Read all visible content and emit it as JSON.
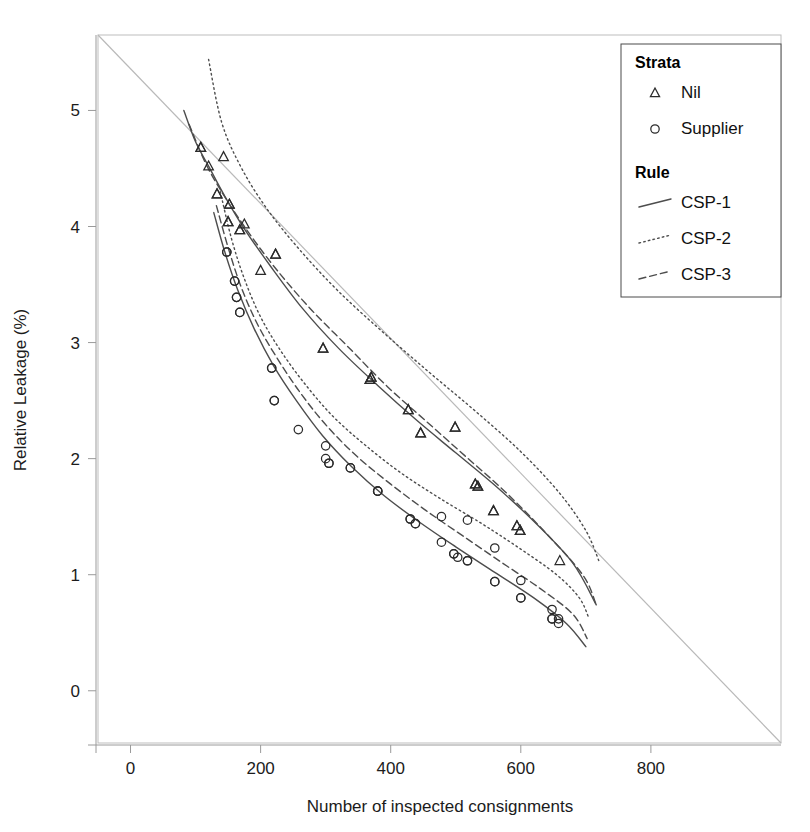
{
  "chart_data": {
    "type": "scatter",
    "title": "",
    "xlabel": "Number of inspected consignments",
    "ylabel": "Relative Leakage (%)",
    "xlim": [
      -50,
      1000
    ],
    "ylim": [
      -0.45,
      5.65
    ],
    "xticks": [
      0,
      200,
      400,
      600,
      800
    ],
    "yticks": [
      0,
      1,
      2,
      3,
      4,
      5
    ],
    "grid": false,
    "legend_position": "top-right",
    "reference_line": {
      "name": "diagonal",
      "points": [
        [
          -50,
          5.65
        ],
        [
          1000,
          -0.45
        ]
      ]
    },
    "legend": {
      "groups": [
        {
          "heading": "Strata",
          "entries": [
            {
              "label": "Nil",
              "marker": "triangle"
            },
            {
              "label": "Supplier",
              "marker": "circle"
            }
          ]
        },
        {
          "heading": "Rule",
          "entries": [
            {
              "label": "CSP-1",
              "line": "solid"
            },
            {
              "label": "CSP-2",
              "line": "dotted"
            },
            {
              "label": "CSP-3",
              "line": "dashed"
            }
          ]
        }
      ]
    },
    "series": [
      {
        "name": "Nil / CSP-1",
        "strata": "Nil",
        "rule": "CSP-1",
        "marker": "triangle",
        "line": "solid",
        "curve": [
          [
            82,
            5.0
          ],
          [
            100,
            4.73
          ],
          [
            120,
            4.52
          ],
          [
            145,
            4.26
          ],
          [
            175,
            3.98
          ],
          [
            215,
            3.66
          ],
          [
            265,
            3.29
          ],
          [
            320,
            2.95
          ],
          [
            380,
            2.63
          ],
          [
            440,
            2.33
          ],
          [
            500,
            2.05
          ],
          [
            560,
            1.77
          ],
          [
            620,
            1.46
          ],
          [
            680,
            1.1
          ],
          [
            716,
            0.74
          ]
        ],
        "points": [
          [
            108,
            4.68
          ],
          [
            120,
            4.52
          ],
          [
            133,
            4.28
          ],
          [
            150,
            4.04
          ],
          [
            152,
            4.19
          ],
          [
            168,
            3.97
          ],
          [
            223,
            3.76
          ],
          [
            296,
            2.95
          ],
          [
            368,
            2.68
          ],
          [
            370,
            2.7
          ],
          [
            427,
            2.42
          ],
          [
            446,
            2.22
          ],
          [
            499,
            2.27
          ],
          [
            530,
            1.78
          ],
          [
            534,
            1.76
          ],
          [
            558,
            1.55
          ],
          [
            594,
            1.42
          ],
          [
            599,
            1.38
          ]
        ]
      },
      {
        "name": "Nil / CSP-2",
        "strata": "Nil",
        "rule": "CSP-2",
        "marker": "triangle",
        "line": "dotted",
        "curve": [
          [
            120,
            5.44
          ],
          [
            140,
            4.9
          ],
          [
            170,
            4.51
          ],
          [
            210,
            4.15
          ],
          [
            260,
            3.8
          ],
          [
            320,
            3.44
          ],
          [
            390,
            3.08
          ],
          [
            460,
            2.74
          ],
          [
            530,
            2.41
          ],
          [
            600,
            2.06
          ],
          [
            660,
            1.7
          ],
          [
            700,
            1.38
          ],
          [
            720,
            1.12
          ]
        ],
        "points": [
          [
            143,
            4.6
          ],
          [
            152,
            4.19
          ],
          [
            175,
            4.02
          ],
          [
            223,
            3.76
          ],
          [
            296,
            2.95
          ],
          [
            370,
            2.7
          ],
          [
            446,
            2.22
          ],
          [
            499,
            2.27
          ],
          [
            558,
            1.55
          ],
          [
            594,
            1.42
          ],
          [
            660,
            1.12
          ]
        ]
      },
      {
        "name": "Nil / CSP-3",
        "strata": "Nil",
        "rule": "CSP-3",
        "marker": "triangle",
        "line": "dashed",
        "curve": [
          [
            90,
            4.88
          ],
          [
            115,
            4.55
          ],
          [
            140,
            4.3
          ],
          [
            175,
            4.0
          ],
          [
            220,
            3.66
          ],
          [
            275,
            3.3
          ],
          [
            335,
            2.96
          ],
          [
            395,
            2.62
          ],
          [
            455,
            2.32
          ],
          [
            515,
            2.02
          ],
          [
            575,
            1.72
          ],
          [
            635,
            1.38
          ],
          [
            695,
            1.0
          ],
          [
            716,
            0.74
          ]
        ],
        "points": [
          [
            108,
            4.68
          ],
          [
            133,
            4.28
          ],
          [
            150,
            4.04
          ],
          [
            168,
            3.97
          ],
          [
            200,
            3.62
          ],
          [
            368,
            2.68
          ],
          [
            427,
            2.42
          ],
          [
            530,
            1.78
          ],
          [
            534,
            1.76
          ],
          [
            599,
            1.38
          ]
        ]
      },
      {
        "name": "Supplier / CSP-1",
        "strata": "Supplier",
        "rule": "CSP-1",
        "marker": "circle",
        "line": "solid",
        "curve": [
          [
            128,
            4.12
          ],
          [
            145,
            3.78
          ],
          [
            165,
            3.45
          ],
          [
            190,
            3.12
          ],
          [
            220,
            2.8
          ],
          [
            255,
            2.5
          ],
          [
            295,
            2.2
          ],
          [
            340,
            1.93
          ],
          [
            390,
            1.68
          ],
          [
            445,
            1.45
          ],
          [
            500,
            1.24
          ],
          [
            560,
            1.02
          ],
          [
            620,
            0.8
          ],
          [
            670,
            0.58
          ],
          [
            700,
            0.38
          ]
        ],
        "points": [
          [
            148,
            3.78
          ],
          [
            160,
            3.53
          ],
          [
            163,
            3.39
          ],
          [
            168,
            3.26
          ],
          [
            217,
            2.78
          ],
          [
            221,
            2.5
          ],
          [
            300,
            2.0
          ],
          [
            305,
            1.96
          ],
          [
            338,
            1.92
          ],
          [
            380,
            1.72
          ],
          [
            430,
            1.48
          ],
          [
            438,
            1.44
          ],
          [
            478,
            1.28
          ],
          [
            497,
            1.18
          ],
          [
            503,
            1.15
          ],
          [
            518,
            1.12
          ],
          [
            560,
            0.94
          ],
          [
            600,
            0.8
          ],
          [
            648,
            0.62
          ],
          [
            658,
            0.58
          ]
        ]
      },
      {
        "name": "Supplier / CSP-2",
        "strata": "Supplier",
        "rule": "CSP-2",
        "marker": "circle",
        "line": "dotted",
        "curve": [
          [
            138,
            4.3
          ],
          [
            155,
            3.9
          ],
          [
            175,
            3.55
          ],
          [
            200,
            3.22
          ],
          [
            232,
            2.92
          ],
          [
            270,
            2.63
          ],
          [
            312,
            2.36
          ],
          [
            360,
            2.12
          ],
          [
            415,
            1.88
          ],
          [
            475,
            1.66
          ],
          [
            540,
            1.44
          ],
          [
            600,
            1.22
          ],
          [
            655,
            1.0
          ],
          [
            690,
            0.8
          ],
          [
            705,
            0.62
          ]
        ],
        "points": [
          [
            160,
            3.53
          ],
          [
            168,
            3.26
          ],
          [
            221,
            2.5
          ],
          [
            258,
            2.25
          ],
          [
            300,
            2.11
          ],
          [
            338,
            1.92
          ],
          [
            380,
            1.72
          ],
          [
            430,
            1.48
          ],
          [
            478,
            1.5
          ],
          [
            518,
            1.47
          ],
          [
            560,
            1.23
          ],
          [
            600,
            0.95
          ],
          [
            648,
            0.7
          ],
          [
            658,
            0.62
          ]
        ]
      },
      {
        "name": "Supplier / CSP-3",
        "strata": "Supplier",
        "rule": "CSP-3",
        "marker": "circle",
        "line": "dashed",
        "curve": [
          [
            132,
            4.18
          ],
          [
            150,
            3.82
          ],
          [
            170,
            3.48
          ],
          [
            195,
            3.16
          ],
          [
            226,
            2.86
          ],
          [
            262,
            2.56
          ],
          [
            302,
            2.28
          ],
          [
            348,
            2.02
          ],
          [
            400,
            1.78
          ],
          [
            455,
            1.55
          ],
          [
            512,
            1.33
          ],
          [
            572,
            1.1
          ],
          [
            630,
            0.88
          ],
          [
            680,
            0.66
          ],
          [
            702,
            0.45
          ]
        ],
        "points": [
          [
            148,
            3.78
          ],
          [
            163,
            3.39
          ],
          [
            217,
            2.78
          ],
          [
            305,
            1.96
          ],
          [
            380,
            1.72
          ],
          [
            438,
            1.44
          ],
          [
            497,
            1.18
          ],
          [
            518,
            1.12
          ],
          [
            560,
            0.94
          ],
          [
            600,
            0.8
          ],
          [
            648,
            0.62
          ]
        ]
      }
    ]
  },
  "colors": {
    "line": "#4d4d4d",
    "marker": "#2b2b2b",
    "reference": "#b9b9b9",
    "panel_border": "#bdbdbd",
    "text": "#1c1c1c",
    "legend_border": "#4a4a4a",
    "background": "#ffffff"
  }
}
